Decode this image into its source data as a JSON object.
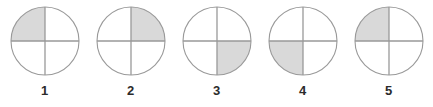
{
  "figure": {
    "type": "quadrant-circle-series",
    "background_color": "#ffffff",
    "shade_color": "#d9d9d9",
    "stroke_color": "#999999",
    "label_color": "#2b2b2b",
    "circle_diameter": 70,
    "items": [
      {
        "label": "1",
        "shaded_quadrant": "top-left",
        "left": 1
      },
      {
        "label": "2",
        "shaded_quadrant": "top-right",
        "left": 87
      },
      {
        "label": "3",
        "shaded_quadrant": "bottom-right",
        "left": 173
      },
      {
        "label": "4",
        "shaded_quadrant": "bottom-left",
        "left": 259
      },
      {
        "label": "5",
        "shaded_quadrant": "top-left",
        "left": 345
      }
    ]
  }
}
